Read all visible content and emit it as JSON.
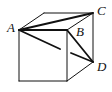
{
  "figure": {
    "labels": {
      "A": "A",
      "B": "B",
      "C": "C",
      "D": "D"
    },
    "stroke_color": "#111111",
    "background": "#ffffff"
  }
}
